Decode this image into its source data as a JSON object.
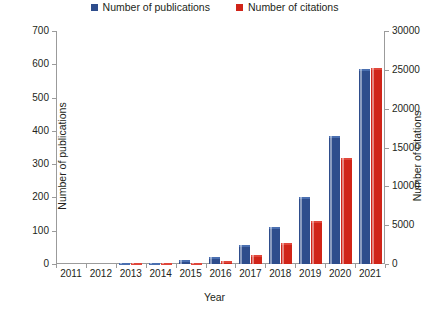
{
  "chart_data": {
    "type": "bar",
    "title": "",
    "xlabel": "Year",
    "ylabel": "Number of publications",
    "y2label": "Number of citations",
    "categories": [
      "2011",
      "2012",
      "2013",
      "2014",
      "2015",
      "2016",
      "2017",
      "2018",
      "2019",
      "2020",
      "2021"
    ],
    "ylim": [
      0,
      700
    ],
    "y2lim": [
      0,
      30000
    ],
    "yticks": [
      0,
      100,
      200,
      300,
      400,
      500,
      600,
      700
    ],
    "y2ticks": [
      0,
      5000,
      10000,
      15000,
      20000,
      25000,
      30000
    ],
    "grid": false,
    "legend_position": "top-center",
    "series": [
      {
        "name": "Number of publications",
        "axis": "left",
        "color": "#2E4D8C",
        "values": [
          0,
          0,
          2,
          4,
          11,
          21,
          57,
          111,
          201,
          385,
          585
        ]
      },
      {
        "name": "Number of citations",
        "axis": "right",
        "color": "#D02418",
        "values": [
          0,
          0,
          20,
          60,
          170,
          430,
          1150,
          2700,
          5600,
          13600,
          25200
        ]
      }
    ]
  },
  "legend": {
    "entries": [
      {
        "label": "Number of publications",
        "color": "#2E4D8C",
        "marker": "square-blue-icon"
      },
      {
        "label": "Number of citations",
        "color": "#D02418",
        "marker": "square-red-icon"
      }
    ]
  },
  "axes": {
    "x_title": "Year",
    "y_left_title": "Number of publications",
    "y_right_title": "Number of citations"
  }
}
